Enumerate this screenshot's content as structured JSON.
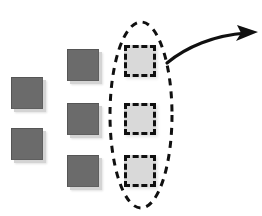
{
  "diagram": {
    "background_color": "#ffffff",
    "canvas": {
      "width": 262,
      "height": 216
    },
    "columns": [
      {
        "name": "left-column",
        "style": "solid-gray",
        "fill_color": "#6b6b6b",
        "shadow_color": "#d4d4d4",
        "squares": [
          {
            "label": "",
            "x": 11,
            "y": 77,
            "size": 32
          },
          {
            "label": "",
            "x": 11,
            "y": 128,
            "size": 32
          }
        ]
      },
      {
        "name": "middle-column",
        "style": "solid-gray",
        "fill_color": "#6b6b6b",
        "shadow_color": "#d4d4d4",
        "squares": [
          {
            "label": "",
            "x": 67,
            "y": 49,
            "size": 32
          },
          {
            "label": "",
            "x": 67,
            "y": 103,
            "size": 32
          },
          {
            "label": "",
            "x": 67,
            "y": 155,
            "size": 32
          }
        ]
      },
      {
        "name": "highlighted-column",
        "style": "dashed-light",
        "fill_color": "#d9d9d9",
        "border_color": "#101010",
        "squares": [
          {
            "label": "",
            "x": 124,
            "y": 45,
            "size": 32
          },
          {
            "label": "",
            "x": 124,
            "y": 103,
            "size": 32
          },
          {
            "label": "",
            "x": 124,
            "y": 155,
            "size": 32
          }
        ]
      }
    ],
    "selection_ellipse": {
      "name": "selection-ellipse",
      "center_x": 141,
      "center_y": 115,
      "radius_x": 31,
      "radius_y": 93,
      "stroke_color": "#101010",
      "stroke_width": 3,
      "dash_pattern": "7 6"
    },
    "callout_arrow": {
      "name": "callout-arrow",
      "stroke_color": "#101010",
      "stroke_width": 3,
      "start_x": 167,
      "start_y": 63,
      "control_x": 205,
      "control_y": 34,
      "end_x": 246,
      "end_y": 33,
      "tip_x": 258,
      "tip_y": 32
    }
  }
}
